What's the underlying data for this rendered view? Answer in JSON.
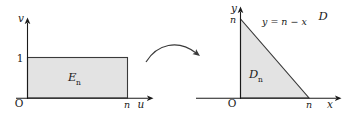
{
  "figure": {
    "type": "diagram",
    "background_color": "#ffffff",
    "line_color": "#1a1a1a",
    "shade_fill": "#e3e3e3",
    "shade_stroke": "#3a3a3a"
  },
  "left_plot": {
    "name": "uv-plane",
    "origin_label": "O",
    "vertical_axis_label": "v",
    "horizontal_axis_label": "u",
    "y_tick_label": "1",
    "x_tick_label": "n",
    "region_label": "E",
    "region_subscript": "n",
    "shape": "rectangle",
    "rect": {
      "x0": 0,
      "y0": 0,
      "x1": "n",
      "y1": 1
    }
  },
  "right_plot": {
    "name": "xy-plane",
    "origin_label": "O",
    "vertical_axis_label": "y",
    "horizontal_axis_label": "x",
    "y_tick_label": "n",
    "x_tick_label": "n",
    "region_label": "D",
    "region_subscript": "n",
    "outer_label": "D",
    "line_equation": "y = n − x",
    "shape": "triangle",
    "vertices": [
      [
        0,
        0
      ],
      [
        "n",
        0
      ],
      [
        0,
        "n"
      ]
    ]
  },
  "arrow": {
    "name": "mapping-arrow",
    "direction": "left-to-right",
    "style": "curved"
  }
}
